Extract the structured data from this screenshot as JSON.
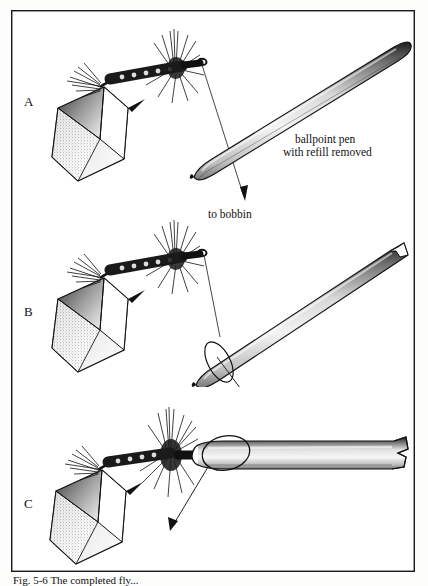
{
  "figure": {
    "type": "instructional-line-drawing",
    "frame_border_color": "#1a1a1a",
    "background_color": "#ffffff",
    "ink_color": "#111111"
  },
  "panels": [
    {
      "letter": "A",
      "description": "Fly in vise at left, thread running from hook eye down to bobbin; ballpoint pen barrel held at an angle to the upper right.",
      "annotations": [
        {
          "id": "ballpoint-pen",
          "line1": "ballpoint pen",
          "line2": "with refill removed"
        },
        {
          "id": "to-bobbin",
          "text": "to bobbin"
        }
      ]
    },
    {
      "letter": "B",
      "description": "Same fly and vise; pen barrel tilted with a looping arrow around its tip indicating the thread being wrapped around the pen point.",
      "annotations": []
    },
    {
      "letter": "C",
      "description": "Pen barrel brought horizontal with its tip against the head of the fly; a loop and arrow show the thread being passed over the pen tip.",
      "annotations": []
    }
  ],
  "labels": {
    "panel_a": "A",
    "panel_b": "B",
    "panel_c": "C",
    "ballpoint_pen_line1": "ballpoint pen",
    "ballpoint_pen_line2": "with refill removed",
    "to_bobbin": "to bobbin"
  },
  "caption": {
    "visible_text": "Fig. 5-6  The completed fly...",
    "note": "caption is cut off by the bottom edge of the screenshot; only the tops of the letters are rendered"
  }
}
